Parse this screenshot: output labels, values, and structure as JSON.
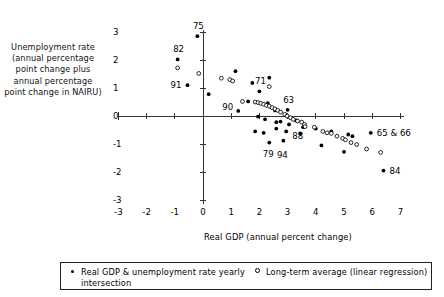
{
  "chart_data": {
    "type": "scatter",
    "title": "",
    "xlabel": "Real GDP (annual percent change)",
    "ylabel": "Unemployment rate (annual percentage point change plus annual percentage point change in NAIRU)",
    "xlim": [
      -3.5,
      7.5
    ],
    "ylim": [
      -3.4,
      3.4
    ],
    "xticks": [
      -3,
      -2,
      -1,
      0,
      1,
      2,
      3,
      4,
      5,
      6,
      7
    ],
    "xticklabels": [
      "-3",
      "-2",
      "-1",
      "0",
      "1",
      "2",
      "3",
      "4",
      "5",
      "6",
      "7"
    ],
    "yticks": [
      -3,
      -2,
      -1,
      0,
      1,
      2,
      3
    ],
    "yticklabels": [
      "-3",
      "-2",
      "-1",
      "0",
      "1",
      "2",
      "3"
    ],
    "grid": false,
    "legend_position": "below",
    "series": [
      {
        "name": "Real GDP & unemployment rate yearly",
        "marker": "filled-circle",
        "color": "#000000",
        "points": [
          {
            "x": -0.2,
            "y": 2.85,
            "label": "75"
          },
          {
            "x": -0.9,
            "y": 2.02,
            "label": "82"
          },
          {
            "x": 2.35,
            "y": 1.37,
            "label": ""
          },
          {
            "x": -0.55,
            "y": 1.1,
            "label": "91"
          },
          {
            "x": 0.2,
            "y": 0.78,
            "label": ""
          },
          {
            "x": 1.15,
            "y": 1.6,
            "label": ""
          },
          {
            "x": 1.75,
            "y": 1.18,
            "label": ""
          },
          {
            "x": 2.0,
            "y": 0.88,
            "label": "71"
          },
          {
            "x": 1.25,
            "y": 0.18,
            "label": "90"
          },
          {
            "x": 1.6,
            "y": 0.52,
            "label": ""
          },
          {
            "x": 2.3,
            "y": 0.46,
            "label": ""
          },
          {
            "x": 2.55,
            "y": 0.2,
            "label": ""
          },
          {
            "x": 3.0,
            "y": 0.22,
            "label": "63"
          },
          {
            "x": 1.95,
            "y": -0.02,
            "label": ""
          },
          {
            "x": 2.2,
            "y": -0.12,
            "label": ""
          },
          {
            "x": 2.6,
            "y": -0.22,
            "label": ""
          },
          {
            "x": 2.75,
            "y": -0.2,
            "label": ""
          },
          {
            "x": 3.05,
            "y": -0.3,
            "label": ""
          },
          {
            "x": 3.3,
            "y": -0.16,
            "label": ""
          },
          {
            "x": 3.55,
            "y": -0.4,
            "label": ""
          },
          {
            "x": 1.85,
            "y": -0.55,
            "label": ""
          },
          {
            "x": 2.15,
            "y": -0.6,
            "label": ""
          },
          {
            "x": 2.6,
            "y": -0.45,
            "label": ""
          },
          {
            "x": 2.95,
            "y": -0.55,
            "label": "88"
          },
          {
            "x": 3.45,
            "y": -0.62,
            "label": ""
          },
          {
            "x": 4.0,
            "y": -0.45,
            "label": ""
          },
          {
            "x": 4.55,
            "y": -0.55,
            "label": ""
          },
          {
            "x": 5.15,
            "y": -0.66,
            "label": ""
          },
          {
            "x": 5.3,
            "y": -0.72,
            "label": ""
          },
          {
            "x": 5.95,
            "y": -0.6,
            "label": "65 & 66"
          },
          {
            "x": 2.35,
            "y": -0.95,
            "label": "79"
          },
          {
            "x": 2.85,
            "y": -0.88,
            "label": "94"
          },
          {
            "x": 4.2,
            "y": -1.05,
            "label": ""
          },
          {
            "x": 5.0,
            "y": -1.28,
            "label": ""
          },
          {
            "x": 6.4,
            "y": -1.95,
            "label": "84"
          }
        ]
      },
      {
        "name": "Long-term average (linear regression) intersection",
        "marker": "open-circle",
        "color": "#000000",
        "points": [
          {
            "x": -0.9,
            "y": 1.72
          },
          {
            "x": -0.15,
            "y": 1.52
          },
          {
            "x": 0.65,
            "y": 1.35
          },
          {
            "x": 0.95,
            "y": 1.3
          },
          {
            "x": 1.05,
            "y": 1.25
          },
          {
            "x": 2.35,
            "y": 1.05
          },
          {
            "x": 1.4,
            "y": 0.52
          },
          {
            "x": 1.85,
            "y": 0.5
          },
          {
            "x": 1.95,
            "y": 0.48
          },
          {
            "x": 2.05,
            "y": 0.45
          },
          {
            "x": 2.15,
            "y": 0.42
          },
          {
            "x": 2.25,
            "y": 0.38
          },
          {
            "x": 2.35,
            "y": 0.35
          },
          {
            "x": 2.45,
            "y": 0.3
          },
          {
            "x": 2.55,
            "y": 0.25
          },
          {
            "x": 2.65,
            "y": 0.2
          },
          {
            "x": 2.75,
            "y": 0.14
          },
          {
            "x": 2.9,
            "y": 0.06
          },
          {
            "x": 2.98,
            "y": 0.0
          },
          {
            "x": 3.1,
            "y": -0.06
          },
          {
            "x": 3.2,
            "y": -0.12
          },
          {
            "x": 3.35,
            "y": -0.18
          },
          {
            "x": 3.5,
            "y": -0.22
          },
          {
            "x": 3.6,
            "y": -0.3
          },
          {
            "x": 3.62,
            "y": -0.38
          },
          {
            "x": 3.95,
            "y": -0.4
          },
          {
            "x": 4.25,
            "y": -0.55
          },
          {
            "x": 4.4,
            "y": -0.6
          },
          {
            "x": 4.55,
            "y": -0.62
          },
          {
            "x": 4.75,
            "y": -0.72
          },
          {
            "x": 4.95,
            "y": -0.8
          },
          {
            "x": 5.05,
            "y": -0.85
          },
          {
            "x": 5.25,
            "y": -0.95
          },
          {
            "x": 5.45,
            "y": -1.02
          },
          {
            "x": 5.8,
            "y": -1.18
          },
          {
            "x": 6.3,
            "y": -1.3
          }
        ]
      }
    ]
  },
  "axis": {
    "ylabel_text": "Unemployment rate (annual percentage point change plus annual percentage point change in NAIRU)",
    "xlabel_text": "Real GDP (annual percent change)"
  },
  "legend": {
    "series1_label": "Real GDP & unemployment rate yearly",
    "series2_label": "Long-term average (linear regression)",
    "series2_label_cont": "intersection"
  }
}
